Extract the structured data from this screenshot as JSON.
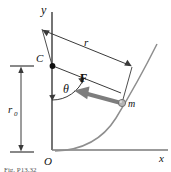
{
  "figure": {
    "type": "physics-free-body-diagram",
    "caption": "Fig. P13.32"
  },
  "axes": {
    "x_label": "x",
    "y_label": "y",
    "origin_label": "O",
    "x_axis_color": "#6e6e6e",
    "y_axis_color": "#3a3a3a"
  },
  "points": {
    "center": {
      "label": "C",
      "x": 52,
      "y": 65,
      "marker": "filled-dot"
    },
    "origin": {
      "label": "O",
      "x": 52,
      "y": 150
    },
    "mass": {
      "label": "m",
      "x": 122,
      "y": 103,
      "marker": "gray-dot"
    }
  },
  "labels": {
    "radius": "r",
    "radius_ref": "r",
    "radius_zero": "r",
    "radius_zero_sub": "0",
    "angle": "θ",
    "force": "F",
    "mass": "m",
    "center": "C"
  },
  "dimensions": {
    "r": {
      "label": "r",
      "from": "C",
      "to": "m",
      "style": "double-arrow-offset"
    },
    "r0": {
      "label": "r0",
      "from": "O",
      "to": "C",
      "style": "double-arrow-vertical"
    }
  },
  "vectors": {
    "force": {
      "label": "F",
      "color": "#7d7d7d",
      "direction": "from mass toward C",
      "style": "thick-gray-arrow"
    }
  },
  "curve": {
    "name": "parabolic-path",
    "color": "#8a8a8a"
  },
  "colors": {
    "ink": "#111111",
    "line": "#3a3a3a",
    "gray": "#8a8a8a",
    "force_gray": "#787878",
    "background": "#ffffff"
  }
}
